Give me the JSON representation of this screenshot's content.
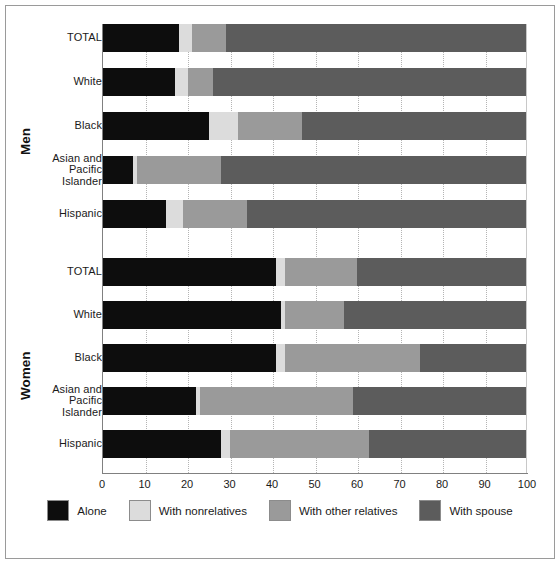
{
  "chart_data": {
    "type": "bar",
    "orientation": "horizontal",
    "stacked": true,
    "title": "",
    "xlabel": "",
    "ylabel": "",
    "xlim": [
      0,
      100
    ],
    "xticks": [
      0,
      10,
      20,
      30,
      40,
      50,
      60,
      70,
      80,
      90,
      100
    ],
    "xtick_labels": [
      "0",
      "10",
      "20",
      "30",
      "40",
      "50",
      "60",
      "70",
      "80",
      "90",
      "100"
    ],
    "grid": true,
    "legend_position": "bottom",
    "series": [
      {
        "name": "Alone",
        "color": "#0d0d0d"
      },
      {
        "name": "With nonrelatives",
        "color": "#dcdcdc"
      },
      {
        "name": "With other relatives",
        "color": "#9a9a9a"
      },
      {
        "name": "With spouse",
        "color": "#5c5c5c"
      }
    ],
    "groups": [
      {
        "label": "Men",
        "categories": [
          "TOTAL",
          "White",
          "Black",
          "Asian and\nPacific\nIslander",
          "Hispanic"
        ],
        "rows": [
          {
            "category": "TOTAL",
            "values": [
              18,
              3,
              8,
              71
            ]
          },
          {
            "category": "White",
            "values": [
              17,
              3,
              6,
              74
            ]
          },
          {
            "category": "Black",
            "values": [
              25,
              7,
              15,
              53
            ]
          },
          {
            "category": "Asian and Pacific Islander",
            "values": [
              7,
              1,
              20,
              72
            ]
          },
          {
            "category": "Hispanic",
            "values": [
              15,
              4,
              15,
              66
            ]
          }
        ]
      },
      {
        "label": "Women",
        "categories": [
          "TOTAL",
          "White",
          "Black",
          "Asian and\nPacific\nIslander",
          "Hispanic"
        ],
        "rows": [
          {
            "category": "TOTAL",
            "values": [
              41,
              2,
              17,
              40
            ]
          },
          {
            "category": "White",
            "values": [
              42,
              1,
              14,
              43
            ]
          },
          {
            "category": "Black",
            "values": [
              41,
              2,
              32,
              25
            ]
          },
          {
            "category": "Asian and Pacific Islander",
            "values": [
              22,
              1,
              36,
              41
            ]
          },
          {
            "category": "Hispanic",
            "values": [
              28,
              2,
              33,
              37
            ]
          }
        ]
      }
    ]
  },
  "labels": {
    "men": "Men",
    "women": "Women",
    "total": "TOTAL",
    "white": "White",
    "black": "Black",
    "asian_line1": "Asian and",
    "asian_line2": "Pacific",
    "asian_line3": "Islander",
    "hispanic": "Hispanic"
  },
  "ticks": {
    "t0": "0",
    "t10": "10",
    "t20": "20",
    "t30": "30",
    "t40": "40",
    "t50": "50",
    "t60": "60",
    "t70": "70",
    "t80": "80",
    "t90": "90",
    "t100": "100"
  },
  "legend": {
    "items": [
      {
        "label": "Alone",
        "color": "#0d0d0d"
      },
      {
        "label": "With nonrelatives",
        "color": "#dcdcdc"
      },
      {
        "label": "With other relatives",
        "color": "#9a9a9a"
      },
      {
        "label": "With spouse",
        "color": "#5c5c5c"
      }
    ]
  }
}
